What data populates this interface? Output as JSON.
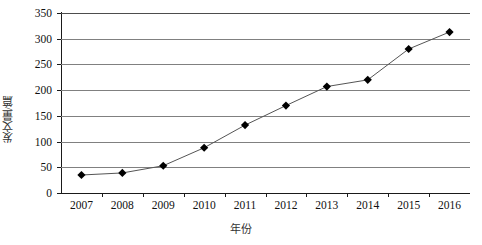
{
  "chart_data": {
    "type": "line",
    "title": "",
    "xlabel": "年份",
    "ylabel": "发文量/篇",
    "categories": [
      "2007",
      "2008",
      "2009",
      "2010",
      "2011",
      "2012",
      "2013",
      "2014",
      "2015",
      "2016"
    ],
    "values": [
      35,
      39,
      53,
      88,
      132,
      170,
      207,
      220,
      280,
      313
    ],
    "series": [
      {
        "name": "发文量",
        "values": [
          35,
          39,
          53,
          88,
          132,
          170,
          207,
          220,
          280,
          313
        ]
      }
    ],
    "ylim": [
      0,
      350
    ],
    "y_ticks": [
      "0",
      "50",
      "100",
      "150",
      "200",
      "250",
      "300",
      "350"
    ],
    "y_tick_values": [
      0,
      50,
      100,
      150,
      200,
      250,
      300,
      350
    ],
    "grid": "horizontal",
    "legend": "none",
    "marker": "diamond",
    "marker_color": "#000000",
    "line_color": "#555555"
  }
}
